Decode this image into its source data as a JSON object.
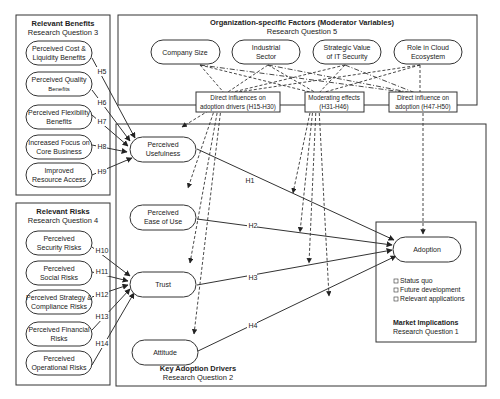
{
  "benefits_group": {
    "title": "Relevant Benefits",
    "subtitle": "Research Question 3",
    "items": [
      {
        "l1": "Perceived Cost &",
        "l2": "Liquidity Benefits",
        "h": "H5"
      },
      {
        "l1": "Perceived Quality",
        "l2": "Benefits",
        "h": "H6"
      },
      {
        "l1": "Perceived Flexibility",
        "l2": "Benefits",
        "h": "H7"
      },
      {
        "l1": "Increased Focus on",
        "l2": "Core Business",
        "h": "H8"
      },
      {
        "l1": "Improved",
        "l2": "Resource Access",
        "h": "H9"
      }
    ]
  },
  "risks_group": {
    "title": "Relevant  Risks",
    "subtitle": "Research Question 4",
    "items": [
      {
        "l1": "Perceived",
        "l2": "Security Risks",
        "h": "H10"
      },
      {
        "l1": "Perceived",
        "l2": "Social Risks",
        "h": "H11"
      },
      {
        "l1": "Perceived Strategy &",
        "l2": "Compliance Risks",
        "h": "H12"
      },
      {
        "l1": "Perceived Financial",
        "l2": "Risks",
        "h": "H13"
      },
      {
        "l1": "Perceived",
        "l2": "Operational Risks",
        "h": "H14"
      }
    ]
  },
  "moderators_group": {
    "title": "Organization-specific Factors (Moderator Variables)",
    "subtitle": "Research Question 5",
    "items": [
      {
        "l1": "Company Size",
        "l2": ""
      },
      {
        "l1": "Industrial",
        "l2": "Sector"
      },
      {
        "l1": "Strategic Value",
        "l2": "of IT Security"
      },
      {
        "l1": "Role in Cloud",
        "l2": "Ecosystem"
      }
    ],
    "effects": [
      {
        "l1": "Direct influences on",
        "l2": "adoption drivers (H15-H30)"
      },
      {
        "l1": "Moderating effects",
        "l2": "(H31-H46)"
      },
      {
        "l1": "Direct influence on",
        "l2": "adoption (H47-H50)"
      }
    ]
  },
  "drivers_group": {
    "title": "Key Adoption Drivers",
    "subtitle": "Research Question 2",
    "items": [
      {
        "l1": "Perceived",
        "l2": "Usefulness",
        "h": "H1"
      },
      {
        "l1": "Perceived",
        "l2": "Ease of Use",
        "h": "H2"
      },
      {
        "l1": "Trust",
        "l2": "",
        "h": "H3"
      },
      {
        "l1": "Attitude",
        "l2": "",
        "h": "H4"
      }
    ]
  },
  "market_group": {
    "node": "Adoption",
    "bullets": [
      "Status quo",
      "Future development",
      "Relevant applications"
    ],
    "title": "Market Implications",
    "subtitle": "Research Question 1"
  }
}
